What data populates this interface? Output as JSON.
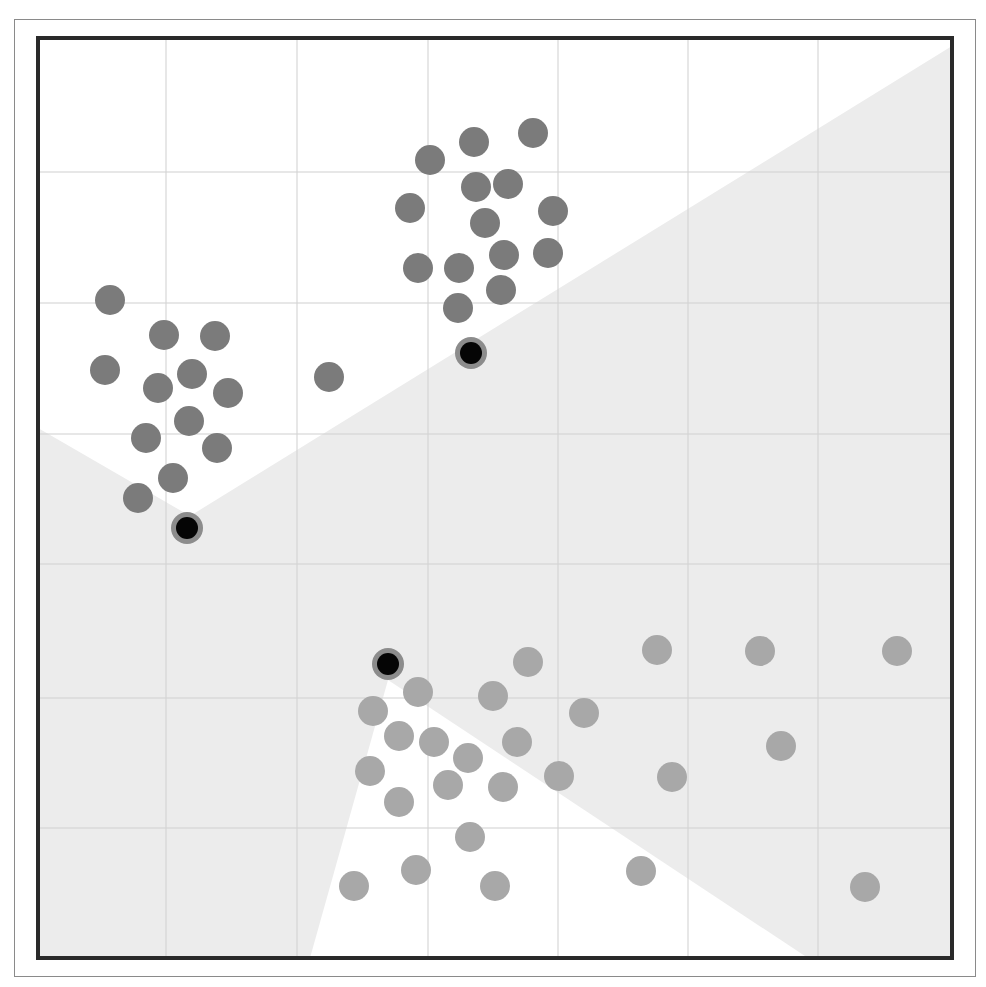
{
  "chart_data": {
    "type": "scatter",
    "title": "",
    "xlabel": "",
    "ylabel": "",
    "grid": true,
    "legend": null,
    "plot_area": {
      "x0": 38,
      "y0": 38,
      "x1": 952,
      "y1": 958
    },
    "grid_lines": {
      "x": [
        166,
        297,
        428,
        558,
        688,
        818
      ],
      "y": [
        172,
        303,
        434,
        564,
        698,
        828
      ]
    },
    "colors": {
      "background_region": "#ffffff",
      "shaded_region": "#ececec",
      "grid": "#d4d4d4",
      "cluster_dark": "#7b7b7b",
      "cluster_light": "#a8a8a8",
      "centroid_fill": "#050505",
      "centroid_ring": "#8c8c8c",
      "border": "#2a2a2a"
    },
    "regions": [
      {
        "name": "white-region-top",
        "fill": "white",
        "points": [
          [
            38,
            38
          ],
          [
            952,
            38
          ],
          [
            952,
            46
          ],
          [
            190,
            516
          ],
          [
            38,
            428
          ]
        ]
      },
      {
        "name": "white-region-bottom",
        "fill": "white",
        "points": [
          [
            388,
            680
          ],
          [
            808,
            958
          ],
          [
            310,
            958
          ]
        ]
      }
    ],
    "series": [
      {
        "name": "cluster-upper-left",
        "color": "#7b7b7b",
        "points": [
          [
            110,
            300
          ],
          [
            164,
            335
          ],
          [
            215,
            336
          ],
          [
            105,
            370
          ],
          [
            158,
            388
          ],
          [
            192,
            374
          ],
          [
            228,
            393
          ],
          [
            189,
            421
          ],
          [
            146,
            438
          ],
          [
            217,
            448
          ],
          [
            173,
            478
          ],
          [
            138,
            498
          ],
          [
            329,
            377
          ]
        ]
      },
      {
        "name": "cluster-top",
        "color": "#7b7b7b",
        "points": [
          [
            430,
            160
          ],
          [
            474,
            142
          ],
          [
            533,
            133
          ],
          [
            476,
            187
          ],
          [
            508,
            184
          ],
          [
            410,
            208
          ],
          [
            485,
            223
          ],
          [
            553,
            211
          ],
          [
            418,
            268
          ],
          [
            459,
            268
          ],
          [
            504,
            255
          ],
          [
            548,
            253
          ],
          [
            501,
            290
          ],
          [
            458,
            308
          ]
        ]
      },
      {
        "name": "cluster-bottom",
        "color": "#a8a8a8",
        "points": [
          [
            418,
            692
          ],
          [
            373,
            711
          ],
          [
            493,
            696
          ],
          [
            528,
            662
          ],
          [
            399,
            736
          ],
          [
            434,
            742
          ],
          [
            468,
            758
          ],
          [
            517,
            742
          ],
          [
            370,
            771
          ],
          [
            448,
            785
          ],
          [
            503,
            787
          ],
          [
            399,
            802
          ],
          [
            559,
            776
          ],
          [
            584,
            713
          ],
          [
            657,
            650
          ],
          [
            760,
            651
          ],
          [
            897,
            651
          ],
          [
            781,
            746
          ],
          [
            672,
            777
          ],
          [
            470,
            837
          ],
          [
            354,
            886
          ],
          [
            416,
            870
          ],
          [
            495,
            886
          ],
          [
            641,
            871
          ],
          [
            865,
            887
          ]
        ]
      }
    ],
    "centroids": [
      {
        "name": "centroid-1",
        "x": 187,
        "y": 528
      },
      {
        "name": "centroid-2",
        "x": 471,
        "y": 353
      },
      {
        "name": "centroid-3",
        "x": 388,
        "y": 664
      }
    ],
    "point_radius": 15,
    "centroid_inner_radius": 11,
    "centroid_outer_radius": 16
  }
}
